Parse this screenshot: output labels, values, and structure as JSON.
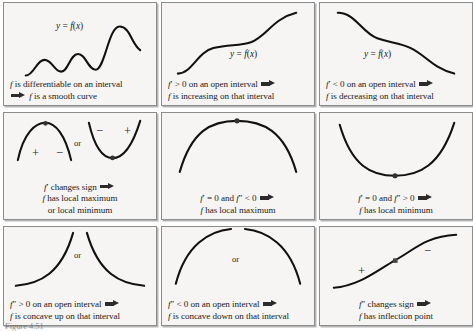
{
  "figure": {
    "caption": "Figure 4.51",
    "columns": 3,
    "rows": 3,
    "cell_background": "#f6f5f3",
    "border_color": "#8c8c8c",
    "curve_color": "#111111"
  },
  "cells": [
    {
      "id": "differentiable-smooth-curve",
      "graph_label": "y = f(x)",
      "curve_kind": "wavy-increasing",
      "lines": [
        "f is differentiable on an interval",
        "⟹ f is a smooth curve"
      ],
      "has_arrow_on_line": 2,
      "signs": [],
      "or_label": ""
    },
    {
      "id": "first-derivative-positive-increasing",
      "graph_label": "y = f(x)",
      "curve_kind": "increasing-sigmoid",
      "lines": [
        "f′ > 0 on an open interval ⟹",
        "f is increasing on that interval"
      ],
      "has_arrow_on_line": 1,
      "signs": [],
      "or_label": ""
    },
    {
      "id": "first-derivative-negative-decreasing",
      "graph_label": "y = f(x)",
      "curve_kind": "decreasing-sigmoid",
      "lines": [
        "f′ < 0 on an open interval ⟹",
        "f is decreasing on that interval"
      ],
      "has_arrow_on_line": 1,
      "signs": [],
      "or_label": ""
    },
    {
      "id": "first-derivative-changes-sign",
      "graph_label": "",
      "curve_kind": "arch-and-valley",
      "lines": [
        "f′ changes sign ⟹",
        "f has local maximum",
        "or local minimum"
      ],
      "has_arrow_on_line": 1,
      "signs": [
        "+",
        "−",
        "−",
        "+"
      ],
      "or_label": "or"
    },
    {
      "id": "local-maximum-second-derivative-negative",
      "graph_label": "",
      "curve_kind": "arch-with-dot",
      "lines": [
        "f′ = 0 and f″ < 0 ⟹",
        "f has local maximum"
      ],
      "has_arrow_on_line": 1,
      "signs": [],
      "or_label": ""
    },
    {
      "id": "local-minimum-second-derivative-positive",
      "graph_label": "",
      "curve_kind": "valley-with-dot",
      "lines": [
        "f′ = 0 and f″ > 0 ⟹",
        "f has local minimum"
      ],
      "has_arrow_on_line": 1,
      "signs": [],
      "or_label": ""
    },
    {
      "id": "concave-up",
      "graph_label": "",
      "curve_kind": "concave-up-pair",
      "lines": [
        "f″ > 0 on an open interval ⟹",
        "f is concave up on that interval"
      ],
      "has_arrow_on_line": 1,
      "signs": [],
      "or_label": "or"
    },
    {
      "id": "concave-down",
      "graph_label": "",
      "curve_kind": "concave-down-pair",
      "lines": [
        "f″ < 0 on an open interval ⟹",
        "f is concave down on that interval"
      ],
      "has_arrow_on_line": 1,
      "signs": [],
      "or_label": "or"
    },
    {
      "id": "inflection-point",
      "graph_label": "",
      "curve_kind": "s-curve-inflection",
      "lines": [
        "f″ changes sign ⟹",
        "f has inflection point"
      ],
      "has_arrow_on_line": 1,
      "signs": [
        "+",
        "−"
      ],
      "or_label": ""
    }
  ]
}
